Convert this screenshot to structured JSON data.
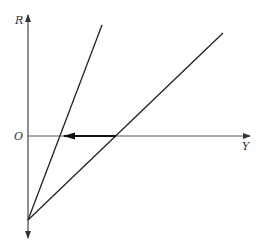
{
  "diagram": {
    "type": "line-diagram",
    "axes": {
      "vertical_label": "R",
      "horizontal_label": "Y",
      "origin_label": "O"
    },
    "lines": [
      {
        "name": "steep-line",
        "from": [
          28,
          220
        ],
        "to": [
          102,
          25
        ]
      },
      {
        "name": "shallow-line",
        "from": [
          28,
          220
        ],
        "to": [
          223,
          33
        ]
      }
    ],
    "shift_arrow": {
      "from": [
        116,
        136
      ],
      "to": [
        64,
        136
      ],
      "direction": "left"
    },
    "colors": {
      "line": "#222222",
      "axis": "#444444",
      "background": "#ffffff"
    }
  }
}
